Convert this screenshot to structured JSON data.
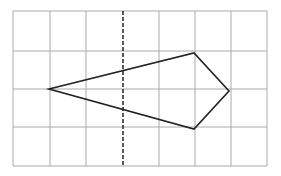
{
  "diagram": {
    "type": "grid-with-polygon",
    "grid": {
      "columns": 7,
      "rows": 4,
      "x_lines": [
        13,
        50,
        86,
        123,
        159,
        195,
        231,
        267
      ],
      "y_lines": [
        11,
        51,
        89,
        127,
        166
      ],
      "line_color": "#aaaaaa"
    },
    "axis_of_symmetry": {
      "style": "dashed",
      "x": 123,
      "y1": 11,
      "y2": 166,
      "color": "#222222"
    },
    "polygon": {
      "shape": "kite",
      "vertices": [
        [
          49,
          89
        ],
        [
          194,
          53
        ],
        [
          229,
          91
        ],
        [
          194,
          129
        ]
      ],
      "stroke": "#222222"
    }
  }
}
